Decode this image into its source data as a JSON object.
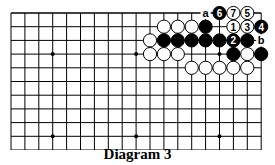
{
  "diagram": {
    "caption": "Diagram 3",
    "grid": {
      "cols": 19,
      "rows_visible": 11,
      "x0": 11,
      "y0": 13,
      "dx": 13.9,
      "dy": 13.7
    },
    "hoshi": [
      [
        3,
        3
      ],
      [
        9,
        3
      ],
      [
        15,
        3
      ],
      [
        3,
        9
      ],
      [
        9,
        9
      ],
      [
        15,
        9
      ]
    ],
    "stones": [
      {
        "c": 15,
        "r": 0,
        "color": "black",
        "label": "6"
      },
      {
        "c": 16,
        "r": 0,
        "color": "white",
        "label": "7"
      },
      {
        "c": 17,
        "r": 0,
        "color": "white",
        "label": "5"
      },
      {
        "c": 11,
        "r": 1,
        "color": "white"
      },
      {
        "c": 12,
        "r": 1,
        "color": "white"
      },
      {
        "c": 13,
        "r": 1,
        "color": "white"
      },
      {
        "c": 14,
        "r": 1,
        "color": "black"
      },
      {
        "c": 16,
        "r": 1,
        "color": "white",
        "label": "1"
      },
      {
        "c": 17,
        "r": 1,
        "color": "white",
        "label": "3"
      },
      {
        "c": 18,
        "r": 1,
        "color": "black",
        "label": "4"
      },
      {
        "c": 10,
        "r": 2,
        "color": "white"
      },
      {
        "c": 11,
        "r": 2,
        "color": "black"
      },
      {
        "c": 12,
        "r": 2,
        "color": "black"
      },
      {
        "c": 13,
        "r": 2,
        "color": "black"
      },
      {
        "c": 14,
        "r": 2,
        "color": "black"
      },
      {
        "c": 15,
        "r": 2,
        "color": "black"
      },
      {
        "c": 16,
        "r": 2,
        "color": "black",
        "label": "2"
      },
      {
        "c": 17,
        "r": 2,
        "color": "black"
      },
      {
        "c": 10,
        "r": 3,
        "color": "white"
      },
      {
        "c": 11,
        "r": 3,
        "color": "white"
      },
      {
        "c": 12,
        "r": 3,
        "color": "white"
      },
      {
        "c": 16,
        "r": 3,
        "color": "black"
      },
      {
        "c": 17,
        "r": 3,
        "color": "white"
      },
      {
        "c": 18,
        "r": 3,
        "color": "black"
      },
      {
        "c": 13,
        "r": 4,
        "color": "white"
      },
      {
        "c": 14,
        "r": 4,
        "color": "white"
      },
      {
        "c": 15,
        "r": 4,
        "color": "white"
      },
      {
        "c": 16,
        "r": 4,
        "color": "white"
      },
      {
        "c": 17,
        "r": 4,
        "color": "white"
      }
    ],
    "letters": [
      {
        "c": 14,
        "r": 0,
        "text": "a"
      },
      {
        "c": 18,
        "r": 2,
        "text": "b"
      }
    ]
  }
}
